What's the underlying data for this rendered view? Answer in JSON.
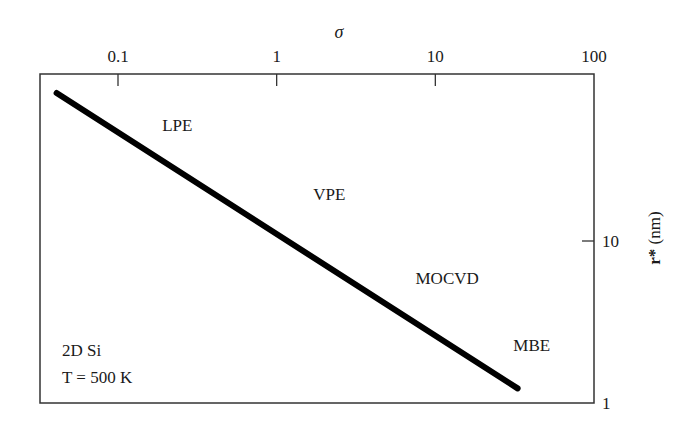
{
  "chart_data": {
    "type": "line",
    "title": "",
    "xlabel": "σ",
    "ylabel_bold": "r*",
    "ylabel_rest": " (nm)",
    "x_axis": {
      "position": "top",
      "scale": "log",
      "range": [
        0.04,
        100
      ],
      "ticks": [
        0.1,
        1,
        10,
        100
      ],
      "tick_labels": [
        "0.1",
        "1",
        "10",
        "100"
      ]
    },
    "y_axis": {
      "position": "right",
      "scale": "log",
      "range": [
        1,
        100
      ],
      "ticks": [
        1,
        10
      ],
      "tick_labels": [
        "1",
        "10"
      ]
    },
    "grid": false,
    "series": [
      {
        "name": "r* vs σ",
        "color": "#000000",
        "x": [
          0.041,
          33
        ],
        "y": [
          82,
          1.23
        ]
      }
    ],
    "annotations": [
      {
        "text": "LPE",
        "x": 0.19,
        "y": 48
      },
      {
        "text": "VPE",
        "x": 1.7,
        "y": 18
      },
      {
        "text": "MOCVD",
        "x": 7.5,
        "y": 5.4
      },
      {
        "text": "MBE",
        "x": 31,
        "y": 2.1
      }
    ],
    "inset_text": [
      "2D Si",
      "T = 500 K"
    ]
  }
}
